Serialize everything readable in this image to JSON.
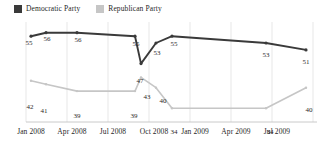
{
  "legend": {
    "position": "top-left",
    "items": [
      {
        "label": "Democratic Party",
        "color": "#3a3a3a",
        "swatch": "legend-swatch-democratic"
      },
      {
        "label": "Republican Party",
        "color": "#c6c6c6",
        "swatch": "legend-swatch-republican"
      }
    ]
  },
  "axis": {
    "ticks": [
      {
        "label": "Jan 2008",
        "x": 31
      },
      {
        "label": "Apr 2008",
        "x": 72
      },
      {
        "label": "Jul 2008",
        "x": 113
      },
      {
        "label": "Oct 2008",
        "x": 154
      },
      {
        "label": "Jan 2009",
        "x": 195
      },
      {
        "label": "Apr 2009",
        "x": 236
      },
      {
        "label": "Jul 2009",
        "x": 277
      }
    ]
  },
  "chart_data": {
    "type": "line",
    "title": "",
    "subtitle": "",
    "xlabel": "",
    "ylabel": "",
    "grid": "vertical",
    "ylim": [
      30,
      60
    ],
    "legend_position": "top-left",
    "categories": [
      "Jan 2008",
      "Feb 2008",
      "Apr 2008",
      "Sep 2008",
      "Oct 2008 (early)",
      "Oct 2008 (late)",
      "Nov 2008",
      "Jun 2009",
      "Sep 2009"
    ],
    "series": [
      {
        "name": "Democratic Party",
        "color": "#3a3a3a",
        "values": [
          55,
          56,
          56,
          55,
          47,
          53,
          55,
          53,
          51
        ],
        "labels": [
          "55",
          "56",
          "56",
          "55",
          "47",
          "53",
          "55",
          "53",
          "51"
        ]
      },
      {
        "name": "Republican Party",
        "color": "#c6c6c6",
        "values": [
          42,
          41,
          39,
          39,
          43,
          40,
          34,
          34,
          40
        ],
        "labels": [
          "42",
          "41",
          "39",
          "39",
          "43",
          "40",
          "34",
          "34",
          "40"
        ]
      }
    ]
  },
  "point_labels": {
    "democratic": [
      {
        "text": "55",
        "x": 29,
        "y": 29
      },
      {
        "text": "56",
        "x": 47,
        "y": 25
      },
      {
        "text": "56",
        "x": 78,
        "y": 26
      },
      {
        "text": "55",
        "x": 136,
        "y": 30
      },
      {
        "text": "47",
        "x": 140,
        "y": 67
      },
      {
        "text": "53",
        "x": 157,
        "y": 39
      },
      {
        "text": "55",
        "x": 174,
        "y": 30
      },
      {
        "text": "53",
        "x": 266,
        "y": 41
      },
      {
        "text": "51",
        "x": 306,
        "y": 48
      }
    ],
    "republican": [
      {
        "text": "42",
        "x": 30,
        "y": 93
      },
      {
        "text": "41",
        "x": 44,
        "y": 97
      },
      {
        "text": "39",
        "x": 77,
        "y": 102
      },
      {
        "text": "39",
        "x": 134,
        "y": 102
      },
      {
        "text": "43",
        "x": 147,
        "y": 83
      },
      {
        "text": "40",
        "x": 163,
        "y": 87
      },
      {
        "text": "34",
        "x": 174,
        "y": 118
      },
      {
        "text": "34",
        "x": 270,
        "y": 118
      },
      {
        "text": "40",
        "x": 309,
        "y": 96
      }
    ]
  },
  "colors": {
    "democratic": "#3a3a3a",
    "republican": "#c6c6c6",
    "grid": "#d8d8d8",
    "axis": "#b8b8b8",
    "text": "#1f1f1f",
    "background": "#ffffff"
  }
}
